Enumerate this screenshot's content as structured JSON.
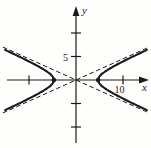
{
  "figure": {
    "background": "#fefefd",
    "ink_color": "#1a1a1a"
  },
  "chart_data": {
    "type": "line",
    "title": "",
    "xlabel": "x",
    "ylabel": "y",
    "xlim": [
      -15.5,
      15.5
    ],
    "ylim": [
      -14.5,
      15.5
    ],
    "grid": false,
    "legend": false,
    "x_axis_ticks": [
      {
        "value": -10,
        "label": ""
      },
      {
        "value": 10,
        "label": "10"
      }
    ],
    "y_axis_ticks": [
      {
        "value": -10,
        "label": ""
      },
      {
        "value": -5,
        "label": ""
      },
      {
        "value": 5,
        "label": "5"
      },
      {
        "value": 10,
        "label": ""
      }
    ],
    "series": [
      {
        "name": "hyperbola",
        "style": "solid",
        "orientation": "horizontal",
        "center": [
          0,
          0
        ],
        "a": 4.7,
        "b": 2.1,
        "vertices": [
          [
            -4.7,
            0
          ],
          [
            4.7,
            0
          ]
        ],
        "y_extent": [
          -6.4,
          6.4
        ]
      },
      {
        "name": "asymptote-positive",
        "style": "dashed",
        "slope": 0.45,
        "intercept": 0
      },
      {
        "name": "asymptote-negative",
        "style": "dashed",
        "slope": -0.45,
        "intercept": 0
      }
    ]
  }
}
